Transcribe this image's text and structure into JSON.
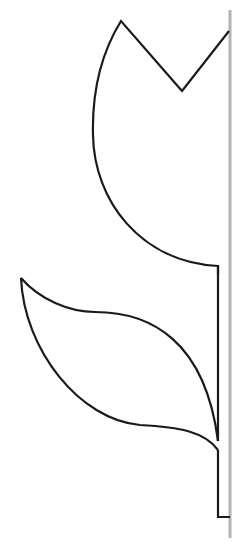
{
  "diagram": {
    "colors": {
      "background": "#ffffff",
      "outline": "#1a1a1a",
      "fold_line": "#b3b3b3"
    },
    "stroke_widths": {
      "outline": 2.2,
      "fold_line": 3
    },
    "fold_line": {
      "x": 230,
      "y1": 10,
      "y2": 538
    },
    "parts": [
      {
        "name": "flower-head",
        "label": "Flower head"
      },
      {
        "name": "stem",
        "label": "Stem"
      },
      {
        "name": "leaf",
        "label": "Leaf"
      }
    ]
  }
}
